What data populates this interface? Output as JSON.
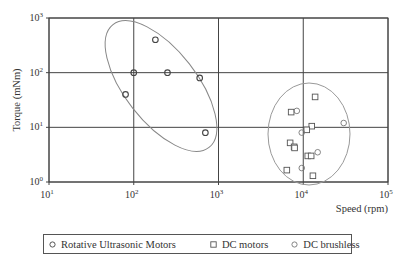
{
  "chart_data": {
    "type": "scatter",
    "title": "",
    "xlabel": "Speed (rpm)",
    "ylabel": "Torque (mNm)",
    "xscale": "log",
    "yscale": "log",
    "xlim": [
      10,
      100000
    ],
    "ylim": [
      1,
      1000
    ],
    "grid": true,
    "x_ticks": [
      {
        "base": "10",
        "exp": "1",
        "value": 10
      },
      {
        "base": "10",
        "exp": "2",
        "value": 100
      },
      {
        "base": "10",
        "exp": "3",
        "value": 1000
      },
      {
        "base": "10",
        "exp": "4",
        "value": 10000
      },
      {
        "base": "10",
        "exp": "5",
        "value": 100000
      }
    ],
    "y_ticks": [
      {
        "base": "10",
        "exp": "0",
        "value": 1
      },
      {
        "base": "10",
        "exp": "1",
        "value": 10
      },
      {
        "base": "10",
        "exp": "2",
        "value": 100
      },
      {
        "base": "10",
        "exp": "3",
        "value": 1000
      }
    ],
    "legend_position": "bottom",
    "series": [
      {
        "name": "Rotative Ultrasonic Motors",
        "marker": "circle",
        "color": "#444444",
        "points": [
          [
            180,
            400
          ],
          [
            100,
            100
          ],
          [
            250,
            100
          ],
          [
            600,
            80
          ],
          [
            80,
            40
          ],
          [
            700,
            8
          ]
        ]
      },
      {
        "name": "DC motors",
        "marker": "square",
        "color": "#555555",
        "points": [
          [
            13800,
            36
          ],
          [
            7200,
            19
          ],
          [
            12600,
            10.5
          ],
          [
            11000,
            9
          ],
          [
            7000,
            5.2
          ],
          [
            7800,
            4.4
          ],
          [
            7900,
            4.2
          ],
          [
            11300,
            3
          ],
          [
            12400,
            3
          ],
          [
            6400,
            1.65
          ],
          [
            13000,
            1.3
          ]
        ]
      },
      {
        "name": "DC brushless",
        "marker": "circle",
        "color": "#777777",
        "points": [
          [
            8400,
            20
          ],
          [
            9600,
            8
          ],
          [
            14800,
            3.5
          ],
          [
            9600,
            1.8
          ],
          [
            30000,
            12
          ]
        ]
      }
    ],
    "annotations": [
      {
        "type": "ellipse",
        "group": "Rotative Ultrasonic Motors",
        "color": "#888888"
      },
      {
        "type": "ellipse",
        "group": "DC motors and DC brushless",
        "color": "#999999"
      }
    ]
  }
}
